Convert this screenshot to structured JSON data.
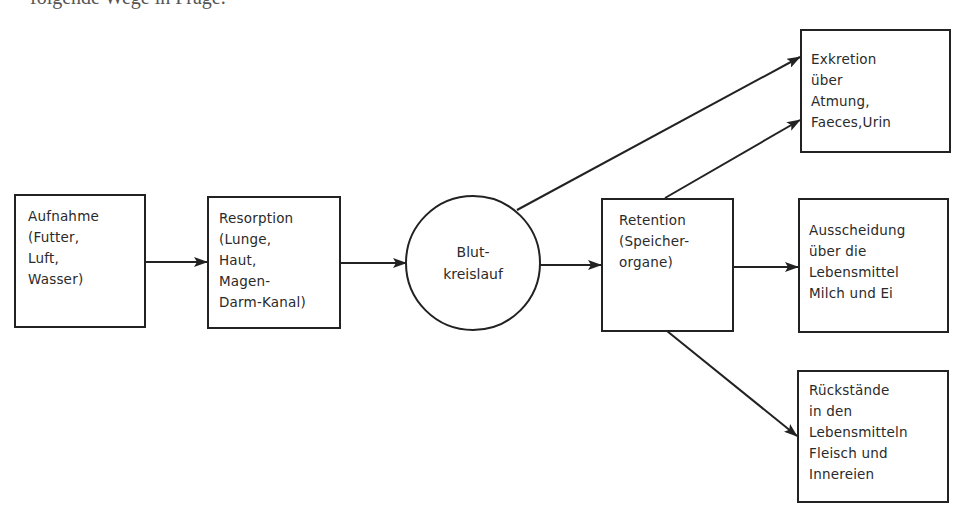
{
  "header": {
    "clipped_text": "folgende Wege in Frage."
  },
  "diagram": {
    "nodes": {
      "intake": {
        "shape": "rectangle",
        "lines": [
          "Aufnahme",
          "(Futter,",
          "Luft,",
          "Wasser)"
        ]
      },
      "resorption": {
        "shape": "rectangle",
        "lines": [
          "Resorption",
          "(Lunge,",
          "Haut,",
          "Magen-",
          "Darm-Kanal)"
        ]
      },
      "circulation": {
        "shape": "circle",
        "lines": [
          "Blut-",
          "kreislauf"
        ]
      },
      "retention": {
        "shape": "rectangle",
        "lines": [
          "Retention",
          "(Speicher-",
          "organe)"
        ]
      },
      "excretion": {
        "shape": "rectangle",
        "lines": [
          "Exkretion",
          "über",
          "Atmung,",
          "Faeces,Urin"
        ]
      },
      "secretion": {
        "shape": "rectangle",
        "lines": [
          "Ausscheidung",
          "über die",
          "Lebensmittel",
          "Milch und Ei"
        ]
      },
      "residues": {
        "shape": "rectangle",
        "lines": [
          "Rückstände",
          "in den",
          "Lebensmitteln",
          "Fleisch und",
          "Innereien"
        ]
      }
    },
    "edges": [
      {
        "from": "intake",
        "to": "resorption"
      },
      {
        "from": "resorption",
        "to": "circulation"
      },
      {
        "from": "circulation",
        "to": "retention"
      },
      {
        "from": "circulation",
        "to": "excretion"
      },
      {
        "from": "retention",
        "to": "excretion"
      },
      {
        "from": "retention",
        "to": "secretion"
      },
      {
        "from": "retention",
        "to": "residues"
      }
    ],
    "colors": {
      "stroke": "#222222",
      "text": "#2a2a2a",
      "background": "#ffffff"
    }
  }
}
